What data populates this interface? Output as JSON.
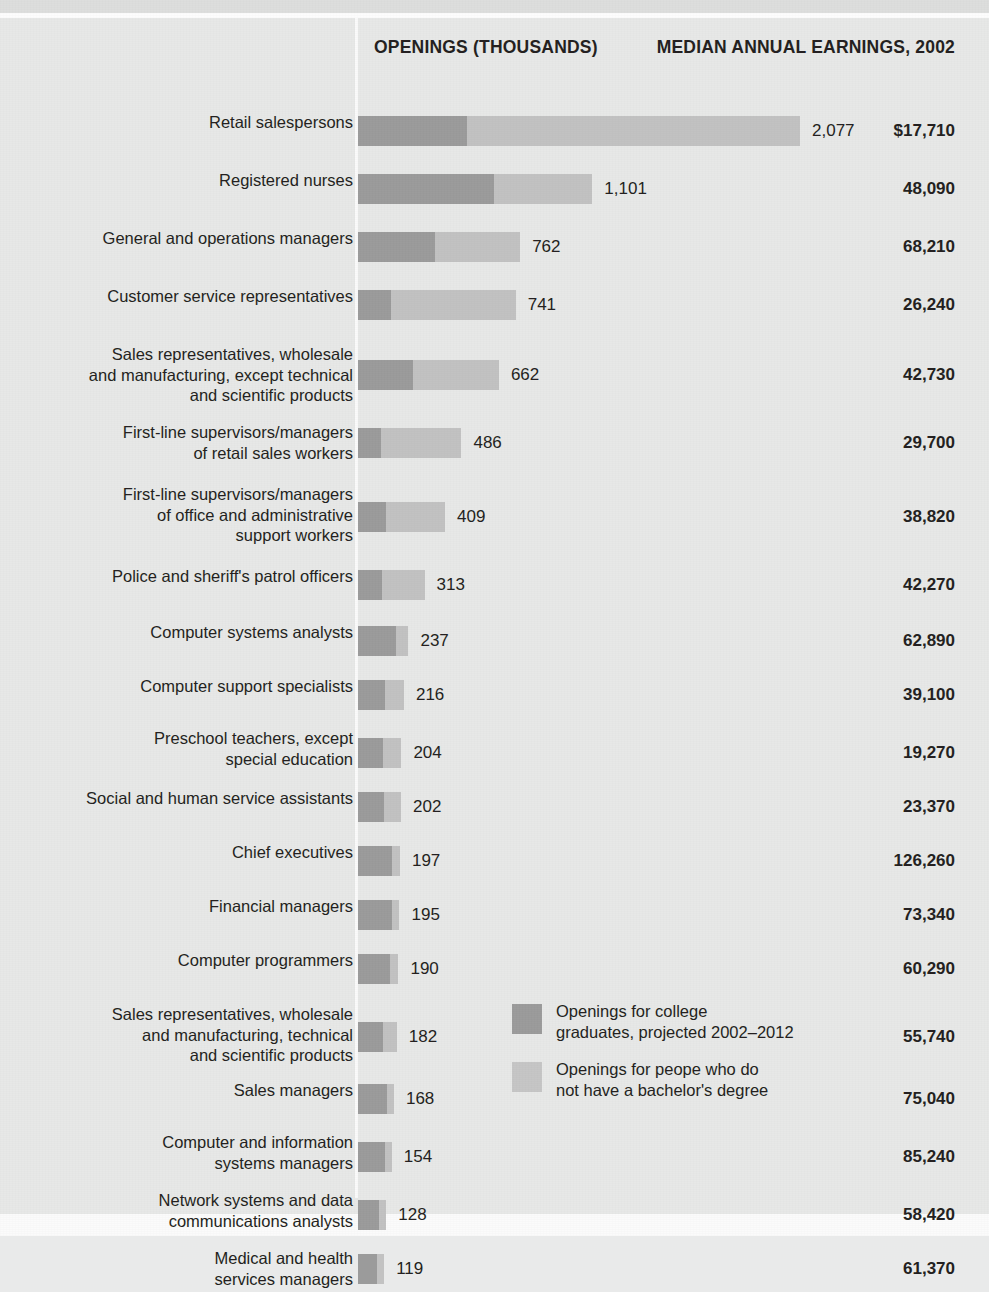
{
  "header": {
    "openings_title": "OPENINGS\n(THOUSANDS)",
    "earnings_title": "MEDIAN ANNUAL\nEARNINGS, 2002"
  },
  "legend": {
    "items": [
      {
        "label": "Openings for college\ngraduates, projected 2002–2012",
        "color": "#9b9b9b",
        "swatch": "dark"
      },
      {
        "label": "Openings for peope who do\nnot have a bachelor's degree",
        "color": "#c6c6c6",
        "swatch": "light"
      }
    ]
  },
  "chart_data": {
    "type": "bar",
    "title": "",
    "xlabel": "Openings (thousands)",
    "ylabel": "",
    "orientation": "horizontal",
    "stacked": true,
    "grid": false,
    "legend_position": "inside-bottom-right",
    "xlim": [
      0,
      2077
    ],
    "categories": [
      "Retail salespersons",
      "Registered nurses",
      "General and operations managers",
      "Customer service representatives",
      "Sales representatives, wholesale\nand manufacturing, except technical\nand scientific products",
      "First-line supervisors/managers\nof retail sales workers",
      "First-line supervisors/managers\nof office and administrative\nsupport workers",
      "Police and sheriff's patrol officers",
      "Computer systems analysts",
      "Computer support specialists",
      "Preschool teachers, except\nspecial education",
      "Social and human service assistants",
      "Chief executives",
      "Financial managers",
      "Computer programmers",
      "Sales representatives, wholesale\nand manufacturing, technical\nand scientific products",
      "Sales managers",
      "Computer and information\nsystems managers",
      "Network systems and data\ncommunications analysts",
      "Medical and health\nservices managers"
    ],
    "series": [
      {
        "name": "Openings for college graduates, projected 2002-2012",
        "color": "#9b9b9b",
        "values": [
          510,
          639,
          362,
          153,
          258,
          108,
          131,
          113,
          180,
          125,
          117,
          120,
          160,
          158,
          150,
          118,
          136,
          126,
          100,
          90
        ]
      },
      {
        "name": "Openings for peope who do not have a bachelor's degree",
        "color": "#c2c2c2",
        "values": [
          1567,
          462,
          400,
          588,
          404,
          378,
          278,
          200,
          57,
          91,
          87,
          82,
          37,
          37,
          40,
          64,
          32,
          28,
          28,
          29
        ]
      }
    ],
    "totals": [
      2077,
      1101,
      762,
      741,
      662,
      486,
      409,
      313,
      237,
      216,
      204,
      202,
      197,
      195,
      190,
      182,
      168,
      154,
      128,
      119
    ],
    "total_labels": [
      "2,077",
      "1,101",
      "762",
      "741",
      "662",
      "486",
      "409",
      "313",
      "237",
      "216",
      "204",
      "202",
      "197",
      "195",
      "190",
      "182",
      "168",
      "154",
      "128",
      "119"
    ],
    "earnings_labels": [
      "$17,710",
      "48,090",
      "68,210",
      "26,240",
      "42,730",
      "29,700",
      "38,820",
      "42,270",
      "62,890",
      "39,100",
      "19,270",
      "23,370",
      "126,260",
      "73,340",
      "60,290",
      "55,740",
      "75,040",
      "85,240",
      "58,420",
      "61,370"
    ],
    "earnings_values": [
      17710,
      48090,
      68210,
      26240,
      42730,
      29700,
      38820,
      42270,
      62890,
      39100,
      19270,
      23370,
      126260,
      73340,
      60290,
      55740,
      75040,
      85240,
      58420,
      61370
    ]
  },
  "rows_layout": [
    {
      "top": 0,
      "h": 60,
      "bar_top": 12,
      "label_top": 8
    },
    {
      "top": 60,
      "h": 58,
      "bar_top": 10,
      "label_top": 6
    },
    {
      "top": 118,
      "h": 58,
      "bar_top": 10,
      "label_top": 6
    },
    {
      "top": 176,
      "h": 58,
      "bar_top": 10,
      "label_top": 6
    },
    {
      "top": 234,
      "h": 78,
      "bar_top": 22,
      "label_top": 6
    },
    {
      "top": 312,
      "h": 62,
      "bar_top": 12,
      "label_top": 6
    },
    {
      "top": 374,
      "h": 82,
      "bar_top": 24,
      "label_top": 6
    },
    {
      "top": 456,
      "h": 58,
      "bar_top": 10,
      "label_top": 6
    },
    {
      "top": 514,
      "h": 54,
      "bar_top": 8,
      "label_top": 4
    },
    {
      "top": 568,
      "h": 54,
      "bar_top": 8,
      "label_top": 4
    },
    {
      "top": 622,
      "h": 58,
      "bar_top": 12,
      "label_top": 2
    },
    {
      "top": 680,
      "h": 54,
      "bar_top": 8,
      "label_top": 4
    },
    {
      "top": 734,
      "h": 54,
      "bar_top": 8,
      "label_top": 4
    },
    {
      "top": 788,
      "h": 54,
      "bar_top": 8,
      "label_top": 4
    },
    {
      "top": 842,
      "h": 54,
      "bar_top": 8,
      "label_top": 4
    },
    {
      "top": 896,
      "h": 76,
      "bar_top": 22,
      "label_top": 4
    },
    {
      "top": 972,
      "h": 54,
      "bar_top": 8,
      "label_top": 4
    },
    {
      "top": 1026,
      "h": 58,
      "bar_top": 12,
      "label_top": 2
    },
    {
      "top": 1084,
      "h": 58,
      "bar_top": 12,
      "label_top": 2
    },
    {
      "top": 1142,
      "h": 54,
      "bar_top": 8,
      "label_top": 2
    }
  ]
}
